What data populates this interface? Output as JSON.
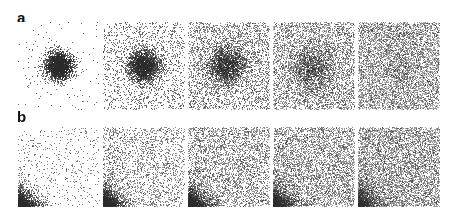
{
  "figure": {
    "title": "",
    "background_color": "#ffffff",
    "width": 459,
    "height": 217,
    "point_color": "#2b2b2b",
    "rows": [
      {
        "label": "a",
        "label_x": 17,
        "label_y": 10,
        "panel_top": 22,
        "panel_width": 82,
        "panel_height": 88,
        "column_x": [
          18,
          103,
          188,
          273,
          358
        ]
      },
      {
        "label": "b",
        "label_x": 17,
        "label_y": 109,
        "panel_top": 127,
        "panel_width": 82,
        "panel_height": 80,
        "column_x": [
          18,
          103,
          188,
          273,
          358
        ]
      }
    ]
  },
  "chart_data": {
    "type": "scatter",
    "title": "",
    "xlabel": "",
    "ylabel": "",
    "grid": false,
    "legend": null,
    "axis_ticks": false,
    "panel_count": 10,
    "columns": [
      "1",
      "2",
      "3",
      "4",
      "5"
    ],
    "series": [
      {
        "name": "a",
        "description": "Centered Gaussian cluster progressively diffusing into uniform noise",
        "distribution": "gaussian-plus-uniform",
        "panels": [
          {
            "index": 1,
            "n_gaussian": 2600,
            "n_uniform": 120,
            "sigma": 0.085,
            "center_x": 0.5,
            "center_y": 0.5,
            "point_size": 1.0,
            "alpha": 0.72,
            "seed": 1101
          },
          {
            "index": 2,
            "n_gaussian": 2500,
            "n_uniform": 1500,
            "sigma": 0.1,
            "center_x": 0.5,
            "center_y": 0.5,
            "point_size": 1.0,
            "alpha": 0.66,
            "seed": 1202
          },
          {
            "index": 3,
            "n_gaussian": 2100,
            "n_uniform": 2900,
            "sigma": 0.12,
            "center_x": 0.47,
            "center_y": 0.5,
            "point_size": 1.0,
            "alpha": 0.58,
            "seed": 1303
          },
          {
            "index": 4,
            "n_gaussian": 1500,
            "n_uniform": 4200,
            "sigma": 0.145,
            "center_x": 0.47,
            "center_y": 0.53,
            "point_size": 1.0,
            "alpha": 0.5,
            "seed": 1404
          },
          {
            "index": 5,
            "n_gaussian": 500,
            "n_uniform": 5600,
            "sigma": 0.2,
            "center_x": 0.5,
            "center_y": 0.5,
            "point_size": 1.0,
            "alpha": 0.44,
            "seed": 1505
          }
        ]
      },
      {
        "name": "b",
        "description": "Density decaying exponentially from the left and bottom edges, filling toward uniform noise",
        "distribution": "exponential-edge-plus-uniform",
        "panels": [
          {
            "index": 1,
            "n_edge": 1500,
            "n_uniform": 500,
            "decay_x": 0.085,
            "decay_y": 0.075,
            "point_size": 1.0,
            "alpha": 0.6,
            "seed": 2101
          },
          {
            "index": 2,
            "n_edge": 1700,
            "n_uniform": 2000,
            "decay_x": 0.09,
            "decay_y": 0.08,
            "point_size": 1.0,
            "alpha": 0.56,
            "seed": 2202
          },
          {
            "index": 3,
            "n_edge": 1800,
            "n_uniform": 3300,
            "decay_x": 0.095,
            "decay_y": 0.085,
            "point_size": 1.0,
            "alpha": 0.52,
            "seed": 2303
          },
          {
            "index": 4,
            "n_edge": 1700,
            "n_uniform": 4400,
            "decay_x": 0.105,
            "decay_y": 0.095,
            "point_size": 1.0,
            "alpha": 0.48,
            "seed": 2404
          },
          {
            "index": 5,
            "n_edge": 1400,
            "n_uniform": 5600,
            "decay_x": 0.12,
            "decay_y": 0.11,
            "point_size": 1.0,
            "alpha": 0.44,
            "seed": 2505
          }
        ]
      }
    ]
  }
}
